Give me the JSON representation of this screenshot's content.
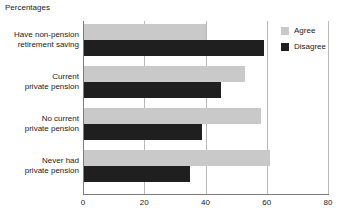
{
  "chart_data": {
    "type": "bar",
    "orientation": "horizontal",
    "title": "Percentages",
    "xlabel": "",
    "ylabel": "",
    "xlim": [
      0,
      80
    ],
    "xticks": [
      0,
      20,
      40,
      60,
      80
    ],
    "xticklabels": [
      "0",
      "20",
      "40",
      "60",
      "80"
    ],
    "grid": true,
    "grid_axis": "x",
    "legend_position": "top-right",
    "categories": [
      "Have non-pension retirement saving",
      "Current private pension",
      "No current private pension",
      "Never had private pension"
    ],
    "category_lines": [
      [
        "Have non-pension",
        "retirement saving"
      ],
      [
        "Current",
        "private pension"
      ],
      [
        "No current",
        "private pension"
      ],
      [
        "Never had",
        "private pension"
      ]
    ],
    "series": [
      {
        "name": "Agree",
        "color": "#c9c9c9",
        "values": [
          40,
          53,
          58,
          61
        ]
      },
      {
        "name": "Disagree",
        "color": "#1f1f1f",
        "values": [
          59,
          45,
          39,
          35
        ]
      }
    ]
  },
  "legend": {
    "items": [
      {
        "label": "Agree",
        "color": "#c9c9c9"
      },
      {
        "label": "Disagree",
        "color": "#1f1f1f"
      }
    ]
  },
  "colors": {
    "agree": "#c9c9c9",
    "disagree": "#1f1f1f",
    "axis": "#7d7d7d",
    "grid": "#b9b9b9",
    "text": "#1a1a1a",
    "background": "#ffffff"
  }
}
